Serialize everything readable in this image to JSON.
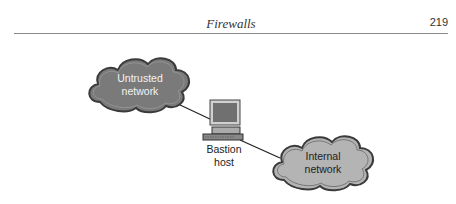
{
  "header": {
    "title": "Firewalls",
    "page_number": "219"
  },
  "diagram": {
    "nodes": [
      {
        "id": "untrusted",
        "type": "cloud",
        "label_line1": "Untrusted",
        "label_line2": "network",
        "fill": "#7a7a7a",
        "text_color": "#f2f2f2"
      },
      {
        "id": "bastion",
        "type": "computer",
        "label_line1": "Bastion",
        "label_line2": "host"
      },
      {
        "id": "internal",
        "type": "cloud",
        "label_line1": "Internal",
        "label_line2": "network",
        "fill": "#b4b4b4",
        "text_color": "#222222"
      }
    ],
    "edges": [
      {
        "from": "untrusted",
        "to": "bastion"
      },
      {
        "from": "bastion",
        "to": "internal"
      }
    ]
  }
}
